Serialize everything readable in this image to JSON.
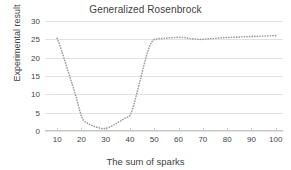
{
  "chart_data": {
    "type": "line",
    "title": "Generalized Rosenbrock",
    "xlabel": "The sum of sparks",
    "ylabel": "Experimental result",
    "xlim": [
      5,
      103
    ],
    "ylim": [
      0,
      30
    ],
    "xticks": [
      10,
      20,
      30,
      40,
      50,
      60,
      70,
      80,
      90,
      100
    ],
    "yticks": [
      0,
      5,
      10,
      15,
      20,
      25,
      30
    ],
    "grid": true,
    "legend": false,
    "line_style": "dotted",
    "marker": "dot",
    "series_color": "#9a9a9a",
    "grid_color": "#e2e2e2",
    "text_color": "#3f3f3f",
    "background": "#ffffff",
    "series": [
      {
        "name": "Generalized Rosenbrock",
        "x": [
          10,
          11,
          12,
          13,
          14,
          15,
          16,
          17,
          18,
          19,
          20,
          21,
          22,
          23,
          24,
          25,
          26,
          27,
          28,
          29,
          30,
          31,
          32,
          33,
          34,
          35,
          36,
          37,
          38,
          39,
          40,
          41,
          42,
          43,
          44,
          45,
          46,
          47,
          48,
          49,
          50,
          51,
          52,
          53,
          54,
          55,
          56,
          57,
          58,
          59,
          60,
          61,
          62,
          63,
          64,
          65,
          66,
          67,
          68,
          69,
          70,
          71,
          72,
          73,
          74,
          75,
          76,
          77,
          78,
          79,
          80,
          81,
          82,
          83,
          84,
          85,
          86,
          87,
          88,
          89,
          90,
          91,
          92,
          93,
          94,
          95,
          96,
          97,
          98,
          99,
          100
        ],
        "y": [
          25.3,
          23.6,
          21.6,
          19.5,
          17.4,
          15.3,
          13.2,
          11.1,
          8.9,
          6.3,
          3.9,
          2.8,
          2.3,
          1.9,
          1.6,
          1.3,
          1.1,
          0.9,
          0.7,
          0.6,
          0.7,
          0.9,
          1.2,
          1.5,
          1.9,
          2.3,
          2.7,
          3.1,
          3.5,
          3.8,
          4.2,
          5.8,
          8.2,
          10.8,
          13.4,
          16.0,
          18.6,
          21.0,
          23.0,
          24.4,
          25.0,
          25.1,
          25.2,
          25.2,
          25.3,
          25.3,
          25.4,
          25.4,
          25.5,
          25.5,
          25.6,
          25.5,
          25.5,
          25.4,
          25.3,
          25.2,
          25.1,
          25.1,
          25.0,
          25.0,
          25.0,
          25.1,
          25.1,
          25.2,
          25.2,
          25.3,
          25.3,
          25.4,
          25.4,
          25.5,
          25.5,
          25.5,
          25.6,
          25.6,
          25.6,
          25.6,
          25.7,
          25.7,
          25.7,
          25.7,
          25.8,
          25.8,
          25.8,
          25.8,
          25.9,
          25.9,
          25.9,
          25.9,
          26.0,
          26.0,
          26.0
        ]
      }
    ]
  }
}
